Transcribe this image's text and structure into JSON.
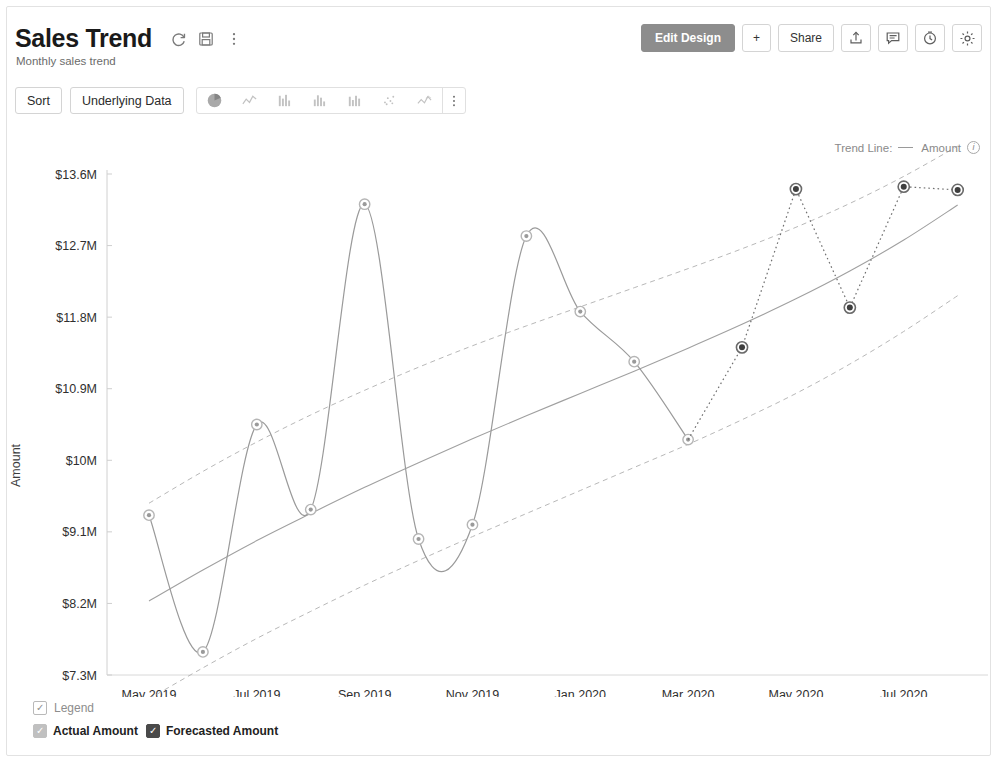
{
  "header": {
    "title": "Sales Trend",
    "subtitle": "Monthly sales trend",
    "refresh_icon": "refresh-icon",
    "save_icon": "save-icon",
    "more_icon": "more-vertical-icon",
    "edit_design_label": "Edit Design",
    "add_label": "+",
    "share_label": "Share",
    "export_icon": "export-icon",
    "comment_icon": "comment-icon",
    "history_icon": "history-icon",
    "settings_icon": "gear-icon"
  },
  "toolbar": {
    "sort_label": "Sort",
    "underlying_data_label": "Underlying Data",
    "chart_types": [
      {
        "name": "pie-chart-icon",
        "active": true
      },
      {
        "name": "line-chart-icon",
        "active": false
      },
      {
        "name": "bar-chart-icon",
        "active": false
      },
      {
        "name": "column-chart-icon",
        "active": false
      },
      {
        "name": "stacked-bar-chart-icon",
        "active": false
      },
      {
        "name": "scatter-chart-icon",
        "active": false
      },
      {
        "name": "area-chart-icon",
        "active": false
      }
    ],
    "more_icon": "more-vertical-icon"
  },
  "trend_legend": {
    "label": "Trend Line:",
    "series": "Amount",
    "info_icon": "info-icon"
  },
  "legend": {
    "legend_label": "Legend",
    "items": [
      {
        "label": "Actual Amount",
        "color": "#c0c0c0",
        "checked": true
      },
      {
        "label": "Forecasted Amount",
        "color": "#4a4a4a",
        "checked": true
      }
    ]
  },
  "chart_data": {
    "type": "line",
    "title": "Sales Trend",
    "subtitle": "Monthly sales trend",
    "xlabel": "",
    "ylabel": "Amount",
    "grid": false,
    "legend_position": "bottom-left",
    "ylim": [
      7.3,
      13.6
    ],
    "ytick_labels": [
      "$13.6M",
      "$12.7M",
      "$11.8M",
      "$10.9M",
      "$10M",
      "$9.1M",
      "$8.2M",
      "$7.3M"
    ],
    "ytick_values": [
      13.6,
      12.7,
      11.8,
      10.9,
      10.0,
      9.1,
      8.2,
      7.3
    ],
    "xtick_labels": [
      "May 2019",
      "Jul 2019",
      "Sep 2019",
      "Nov 2019",
      "Jan 2020",
      "Mar 2020",
      "May 2020",
      "Jul 2020"
    ],
    "x": [
      "May 2019",
      "Jun 2019",
      "Jul 2019",
      "Aug 2019",
      "Sep 2019",
      "Oct 2019",
      "Nov 2019",
      "Dec 2019",
      "Jan 2020",
      "Feb 2020",
      "Mar 2020",
      "Apr 2020",
      "May 2020",
      "Jun 2020",
      "Jul 2020",
      "Aug 2020"
    ],
    "series": [
      {
        "name": "Actual Amount",
        "color": "#9a9a9a",
        "style": "solid",
        "values": [
          9.31,
          7.59,
          10.45,
          9.38,
          13.22,
          9.01,
          9.19,
          12.82,
          11.87,
          11.24,
          10.26,
          null,
          null,
          null,
          null,
          null
        ]
      },
      {
        "name": "Forecasted Amount",
        "color": "#4a4a4a",
        "style": "dotted",
        "values": [
          null,
          null,
          null,
          null,
          null,
          null,
          null,
          null,
          null,
          null,
          10.26,
          11.42,
          13.41,
          11.92,
          13.44,
          13.4
        ]
      },
      {
        "name": "Trend Line Amount",
        "color": "#a0a0a0",
        "style": "solid",
        "values": [
          8.23,
          8.62,
          8.99,
          9.33,
          9.66,
          9.97,
          10.27,
          10.56,
          10.84,
          11.12,
          11.41,
          11.71,
          12.03,
          12.38,
          12.77,
          13.21
        ]
      },
      {
        "name": "Upper Band",
        "color": "#b8b8b8",
        "style": "dashed",
        "values": [
          9.46,
          9.86,
          10.23,
          10.57,
          10.88,
          11.17,
          11.44,
          11.69,
          11.93,
          12.17,
          12.41,
          12.66,
          12.93,
          13.23,
          13.57,
          13.95
        ]
      },
      {
        "name": "Lower Band",
        "color": "#b8b8b8",
        "style": "dashed",
        "values": [
          7.0,
          7.39,
          7.76,
          8.1,
          8.43,
          8.74,
          9.04,
          9.33,
          9.62,
          9.91,
          10.2,
          10.51,
          10.84,
          11.21,
          11.62,
          12.07
        ]
      }
    ]
  }
}
